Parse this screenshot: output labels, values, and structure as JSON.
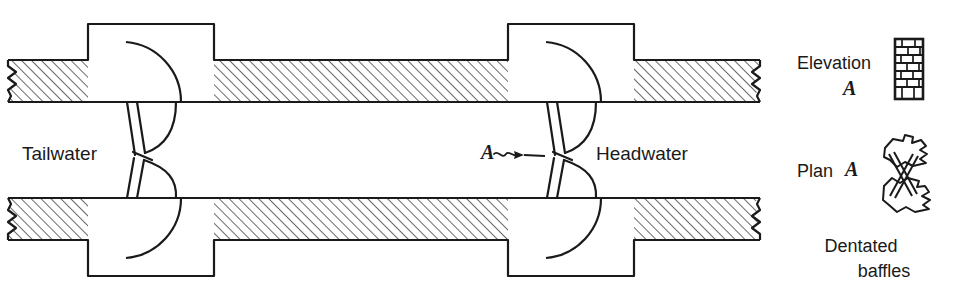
{
  "figure": {
    "type": "engineering-plan-drawing",
    "background_color": "#ffffff",
    "ink_color": "#1a1a1a",
    "hatch_color": "#222222"
  },
  "labels": {
    "tailwater": "Tailwater",
    "headwater": "Headwater",
    "section_marker": "A"
  },
  "legend": {
    "elevation_label": "Elevation",
    "elevation_marker": "A",
    "plan_label": "Plan",
    "plan_marker": "A",
    "caption_line1": "Dentated",
    "caption_line2": "baffles",
    "elevation_icon": "ladder-grid-icon",
    "plan_icon": "dentated-baffle-plan-icon"
  },
  "geometry": {
    "wall_top_y": 60,
    "wall_bottom_y": 240,
    "wall_thickness": 42,
    "channel_left": 0,
    "channel_right": 760,
    "pier_left_x": 88,
    "pier_right_x": 508,
    "pier_width": 126,
    "pier_projection": 36,
    "hatch_angle_deg": 45,
    "hatch_spacing_px": 7
  }
}
